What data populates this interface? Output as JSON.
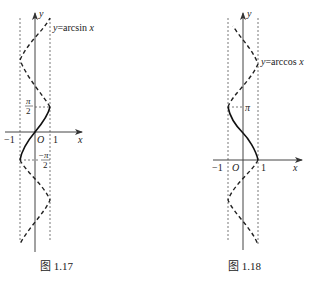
{
  "figures": [
    {
      "caption": "图 1.17",
      "curve_label": "y=arcsin x",
      "axis_x": "x",
      "axis_y": "y",
      "origin": "O",
      "tick_neg1": "−1",
      "tick_pos1": "1",
      "y_tick_top_num": "π",
      "y_tick_top_den": "2",
      "y_tick_bot_num": "−π",
      "y_tick_bot_den": "2"
    },
    {
      "caption": "图 1.18",
      "curve_label": "y=arccos x",
      "axis_x": "x",
      "axis_y": "y",
      "origin": "O",
      "tick_neg1": "−1",
      "tick_pos1": "1",
      "y_tick": "π"
    }
  ]
}
